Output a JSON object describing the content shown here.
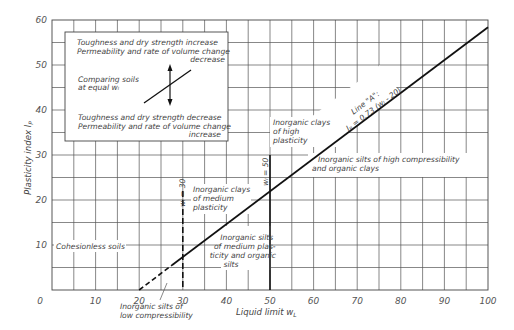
{
  "chart_data": {
    "type": "line",
    "xlabel": "Liquid limit w_L",
    "ylabel": "Plasticity index I_P",
    "xlim": [
      0,
      100
    ],
    "ylim": [
      0,
      60
    ],
    "grid": true,
    "grid_step": {
      "x": 5,
      "y": 5
    },
    "x_ticks": [
      0,
      10,
      20,
      30,
      40,
      50,
      60,
      70,
      80,
      90,
      100
    ],
    "y_ticks": [
      10,
      20,
      30,
      40,
      50,
      60
    ],
    "series": [
      {
        "name": "Line \"A\": I_P = 0.73 (w_L - 20)",
        "x": [
          20,
          27.5,
          100
        ],
        "y": [
          0,
          5.5,
          58.4
        ],
        "dashed_until_x": 27.5
      },
      {
        "name": "w_L = 30",
        "x": [
          30,
          30
        ],
        "y": [
          0,
          22
        ],
        "style": "dashed"
      },
      {
        "name": "w_L = 50",
        "x": [
          50,
          50
        ],
        "y": [
          0,
          30
        ],
        "style": "solid"
      }
    ],
    "annotations": [
      {
        "text": "Cohesionless soils",
        "x": 1,
        "y": 10
      },
      {
        "text": "Inorganic clays of medium plasticity",
        "x": 31,
        "y": 22
      },
      {
        "text": "Inorganic silts of medium plasticity and organic silts",
        "x": 37,
        "y": 11
      },
      {
        "text": "Inorganic silts of low compressibility",
        "x": 21,
        "y": -4
      },
      {
        "text": "Inorganic clays of high plasticity",
        "x": 51,
        "y": 37
      },
      {
        "text": "Inorganic silts of high compressibility and organic clays",
        "x": 54,
        "y": 29
      },
      {
        "text": "w_L = 30",
        "x": 29,
        "y": 22
      },
      {
        "text": "w_L = 50",
        "x": 49,
        "y": 31
      },
      {
        "text": "Line \"A\": I_P = 0.73 (w_L - 20)",
        "x": 65,
        "y": 37
      }
    ],
    "legend": {
      "line1": "Toughness and dry strength increase",
      "line2": "Permeability and rate of volume change",
      "line3": "decrease",
      "middle1": "Comparing soils",
      "middle2": "at equal w_L",
      "line4": "Toughness and dry strength decrease",
      "line5": "Permeability and rate of volume change",
      "line6": "increase"
    }
  },
  "labels": {
    "ylabel": "Plasticity index I",
    "ylabel_sub": "P",
    "xlabel": "Liquid limit w",
    "xlabel_sub": "L",
    "cohesionless": "Cohesionless soils",
    "clays_medium": [
      "Inorganic clays",
      "of medium",
      "plasticity"
    ],
    "silts_medium": [
      "Inorganic silts",
      "of medium plas-",
      "ticity and organic",
      "silts"
    ],
    "silts_low": [
      "Inorganic silts of",
      "low compressibility"
    ],
    "clays_high": [
      "Inorganic clays",
      "of high",
      "plasticity"
    ],
    "silts_high": [
      "Inorganic silts of high compressibility",
      "and organic clays"
    ],
    "wl30": "wₗ = 30",
    "wl50": "wₗ = 50",
    "lineA_title": "Line \"A\":",
    "lineA_eq": "Iₚ = 0.73 (wₗ - 20)",
    "legend": {
      "top1": "Toughness  and dry strength increase",
      "top2": "Permeability and rate of volume change",
      "top3": "decrease",
      "mid1": "Comparing soils",
      "mid2": "at equal  wₗ",
      "bot1": "Toughness and dry strength decrease",
      "bot2": "Permeability and rate of volume change",
      "bot3": "increase"
    },
    "xticks": [
      "0",
      "10",
      "20",
      "30",
      "40",
      "50",
      "60",
      "70",
      "80",
      "90",
      "100"
    ],
    "yticks": [
      "10",
      "20",
      "30",
      "40",
      "50",
      "60"
    ]
  }
}
